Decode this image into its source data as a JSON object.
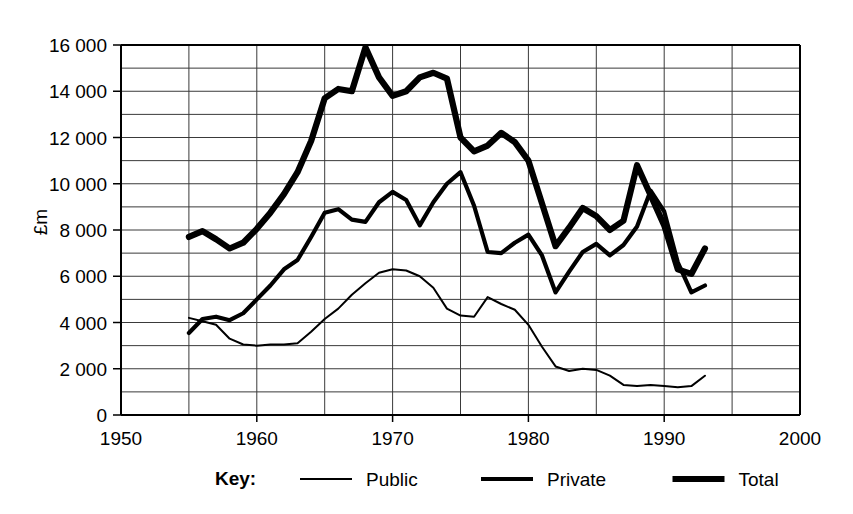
{
  "chart_data": {
    "type": "line",
    "title": "",
    "xlabel": "",
    "ylabel": "£m",
    "xlim": [
      1950,
      2000
    ],
    "ylim": [
      0,
      16000
    ],
    "x_major_ticks": [
      1950,
      1960,
      1970,
      1980,
      1990,
      2000
    ],
    "x_major_tick_labels": [
      "1950",
      "1960",
      "1970",
      "1980",
      "1990",
      "2000"
    ],
    "x_gridline_interval": 5,
    "y_major_ticks": [
      0,
      2000,
      4000,
      6000,
      8000,
      10000,
      12000,
      14000,
      16000
    ],
    "y_major_tick_labels": [
      "0",
      "2 000",
      "4 000",
      "6 000",
      "8 000",
      "10 000",
      "12 000",
      "14 000",
      "16 000"
    ],
    "y_gridline_interval": 1000,
    "grid": true,
    "legend_position": "below",
    "x": [
      1955,
      1956,
      1957,
      1958,
      1959,
      1960,
      1961,
      1962,
      1963,
      1964,
      1965,
      1966,
      1967,
      1968,
      1969,
      1970,
      1971,
      1972,
      1973,
      1974,
      1975,
      1976,
      1977,
      1978,
      1979,
      1980,
      1981,
      1982,
      1983,
      1984,
      1985,
      1986,
      1987,
      1988,
      1989,
      1990,
      1991,
      1992,
      1993
    ],
    "series": [
      {
        "name": "Public",
        "line_weight": "thin",
        "color": "#000000",
        "values": [
          4200,
          4050,
          3900,
          3300,
          3050,
          3000,
          3050,
          3050,
          3100,
          3600,
          4150,
          4600,
          5200,
          5700,
          6150,
          6300,
          6250,
          6000,
          5500,
          4600,
          4300,
          4250,
          5100,
          4800,
          4550,
          3900,
          2950,
          2100,
          1900,
          2000,
          1950,
          1700,
          1300,
          1250,
          1300,
          1250,
          1200,
          1250,
          1700
        ]
      },
      {
        "name": "Private",
        "line_weight": "medium",
        "color": "#000000",
        "values": [
          3550,
          4150,
          4250,
          4100,
          4400,
          5000,
          5600,
          6300,
          6700,
          7700,
          8750,
          8900,
          8450,
          8350,
          9200,
          9650,
          9300,
          8200,
          9200,
          10000,
          10500,
          9050,
          7050,
          7000,
          7450,
          7800,
          6900,
          5300,
          6200,
          7050,
          7400,
          6900,
          7350,
          8150,
          9700,
          8800,
          6600,
          5300,
          5600
        ]
      },
      {
        "name": "Total",
        "line_weight": "thick",
        "color": "#000000",
        "values": [
          7700,
          7950,
          7600,
          7200,
          7450,
          8050,
          8750,
          9550,
          10500,
          11850,
          13700,
          14100,
          14000,
          15900,
          14600,
          13800,
          14000,
          14600,
          14800,
          14550,
          12000,
          11400,
          11650,
          12200,
          11800,
          11000,
          9150,
          7300,
          8100,
          8950,
          8600,
          8000,
          8400,
          10800,
          9500,
          8200,
          6300,
          6100,
          7200
        ]
      }
    ],
    "legend": {
      "title": "Key:",
      "entries": [
        {
          "label": "Public",
          "weight": "thin"
        },
        {
          "label": "Private",
          "weight": "medium"
        },
        {
          "label": "Total",
          "weight": "thick"
        }
      ]
    }
  }
}
